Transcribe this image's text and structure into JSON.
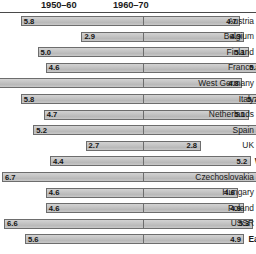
{
  "chart": {
    "type": "diverging-bar",
    "headers": {
      "left_period": "1950–60",
      "right_period": "1960–70"
    }
  },
  "chart_data": {
    "type": "bar",
    "title": "",
    "subtitle": "",
    "xlabel": "",
    "ylabel": "",
    "orientation": "horizontal-diverging",
    "grid": false,
    "legend_position": "top",
    "series": [
      {
        "name": "1950–60",
        "side": "left",
        "values": [
          5.8,
          2.9,
          5.0,
          4.6,
          7.8,
          5.8,
          4.7,
          5.2,
          2.7,
          4.4,
          6.7,
          4.6,
          4.6,
          6.6,
          5.6
        ]
      },
      {
        "name": "1960–70",
        "side": "right",
        "values": [
          4.7,
          4.9,
          5.1,
          5.8,
          4.8,
          5.7,
          5.1,
          7.5,
          2.8,
          5.2,
          6.9,
          4.6,
          4.9,
          5.3,
          4.9
        ]
      }
    ],
    "categories": [
      "Austria",
      "Belgium",
      "Finland",
      "France",
      "West Germany",
      "Italy",
      "Netherlands",
      "Spain",
      "UK",
      "West European average",
      "Czechoslovakia",
      "Hungary",
      "Poland",
      "USSR",
      "East European average"
    ],
    "value_range_left": [
      0,
      7.8
    ],
    "value_range_right": [
      0,
      7.5
    ]
  },
  "rows": [
    {
      "label": "Austria",
      "left": "5.8",
      "right": "4.7",
      "emphasis": false,
      "label_align": "right"
    },
    {
      "label": "Belgium",
      "left": "2.9",
      "right": "4.9",
      "emphasis": false,
      "label_align": "right"
    },
    {
      "label": "Finland",
      "left": "5.0",
      "right": "5.1",
      "emphasis": false,
      "label_align": "right"
    },
    {
      "label": "France",
      "left": "4.6",
      "right": "5.8",
      "emphasis": false,
      "label_align": "right"
    },
    {
      "label": "West Germany",
      "left": "7.8",
      "right": "4.8",
      "emphasis": false,
      "label_align": "right"
    },
    {
      "label": "Italy",
      "left": "5.8",
      "right": "5.7",
      "emphasis": false,
      "label_align": "right"
    },
    {
      "label": "Netherlands",
      "left": "4.7",
      "right": "5.1",
      "emphasis": false,
      "label_align": "right"
    },
    {
      "label": "Spain",
      "left": "5.2",
      "right": "7.5",
      "emphasis": false,
      "label_align": "right"
    },
    {
      "label": "UK",
      "left": "2.7",
      "right": "2.8",
      "emphasis": false,
      "label_align": "right"
    },
    {
      "label": "West European average",
      "left": "4.4",
      "right": "5.2",
      "emphasis": true,
      "label_align": "left"
    },
    {
      "label": "Czechoslovakia",
      "left": "6.7",
      "right": "6.9",
      "emphasis": false,
      "label_align": "right"
    },
    {
      "label": "Hungary",
      "left": "4.6",
      "right": "4.6",
      "emphasis": false,
      "label_align": "right"
    },
    {
      "label": "Poland",
      "left": "4.6",
      "right": "4.9",
      "emphasis": false,
      "label_align": "right"
    },
    {
      "label": "USSR",
      "left": "6.6",
      "right": "5.3",
      "emphasis": false,
      "label_align": "right"
    },
    {
      "label": "East European average",
      "left": "5.6",
      "right": "4.9",
      "emphasis": true,
      "label_align": "left"
    }
  ]
}
